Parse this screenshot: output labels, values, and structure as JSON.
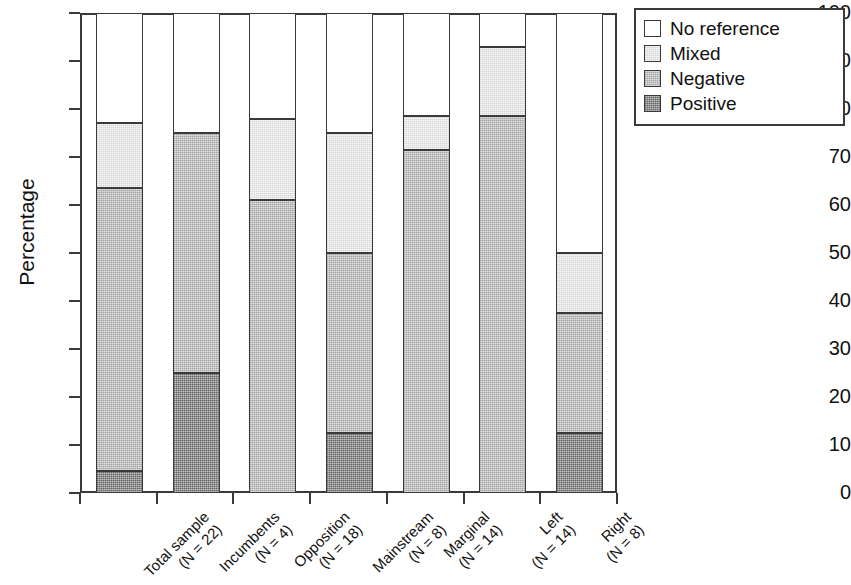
{
  "chart_data": {
    "type": "bar",
    "subtype": "stacked-bar-100",
    "title": "",
    "xlabel": "",
    "ylabel": "Percentage",
    "ylim": [
      0,
      100
    ],
    "yticks": [
      0,
      10,
      20,
      30,
      40,
      50,
      60,
      70,
      80,
      90,
      100
    ],
    "ytick_labels": [
      "0",
      "10",
      "20",
      "30",
      "40",
      "50",
      "60",
      "70",
      "80",
      "90",
      "100"
    ],
    "grid": false,
    "legend_position": "upper-right-outside",
    "categories": [
      "Total sample (N = 22)",
      "Incumbents (N = 4)",
      "Opposition (N = 18)",
      "Mainstream (N = 8)",
      "Marginal (N = 14)",
      "Left (N = 14)",
      "Right (N = 8)"
    ],
    "category_lines": [
      {
        "line1": "Total sample",
        "line2": "(N = 22)"
      },
      {
        "line1": "Incumbents",
        "line2": "(N = 4)"
      },
      {
        "line1": "Opposition",
        "line2": "(N = 18)"
      },
      {
        "line1": "Mainstream",
        "line2": "(N = 8)"
      },
      {
        "line1": "Marginal",
        "line2": "(N = 14)"
      },
      {
        "line1": "Left",
        "line2": "(N = 14)"
      },
      {
        "line1": "Right",
        "line2": "(N = 8)"
      }
    ],
    "series": [
      {
        "name": "Positive",
        "color": "#6e6e6e",
        "values": [
          4.5,
          25.0,
          0.0,
          12.5,
          0.0,
          0.0,
          12.5
        ]
      },
      {
        "name": "Negative",
        "color": "#b5b5b5",
        "values": [
          59.0,
          50.0,
          61.0,
          37.5,
          71.4,
          78.6,
          25.0
        ]
      },
      {
        "name": "Mixed",
        "color": "#ececec",
        "values": [
          13.6,
          0.0,
          17.0,
          25.0,
          7.2,
          14.3,
          12.5
        ]
      },
      {
        "name": "No reference",
        "color": "#ffffff",
        "values": [
          22.9,
          25.0,
          22.0,
          25.0,
          21.4,
          7.1,
          50.0
        ]
      }
    ],
    "cumulative_tops": {
      "positive": [
        4.5,
        25.0,
        0.0,
        12.5,
        0.0,
        0.0,
        12.5
      ],
      "negative": [
        63.5,
        75.0,
        61.0,
        50.0,
        71.4,
        78.6,
        37.5
      ],
      "mixed": [
        77.1,
        75.0,
        78.0,
        75.0,
        78.6,
        92.9,
        50.0
      ],
      "noreference": [
        100.0,
        100.0,
        100.0,
        100.0,
        100.0,
        100.0,
        100.0
      ]
    }
  },
  "legend": {
    "items": [
      {
        "label": "No reference",
        "swatch": "#ffffff",
        "key": "noref"
      },
      {
        "label": "Mixed",
        "swatch": "#ececec",
        "key": "mixed"
      },
      {
        "label": "Negative",
        "swatch": "#b5b5b5",
        "key": "neg"
      },
      {
        "label": "Positive",
        "swatch": "#6e6e6e",
        "key": "pos"
      }
    ]
  }
}
